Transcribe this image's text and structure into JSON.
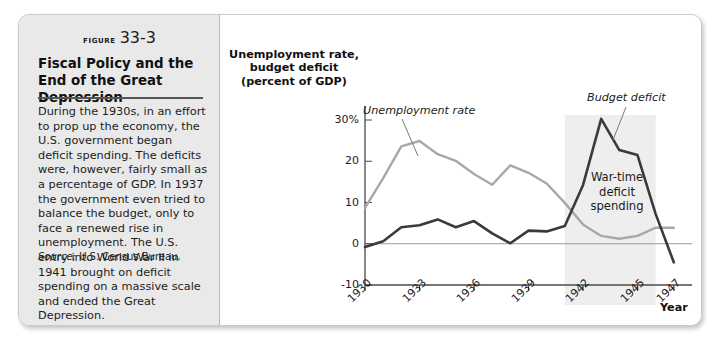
{
  "figure": {
    "number_word": "FIGURE",
    "number": "33-3",
    "title": "Fiscal Policy and the End of the Great Depression",
    "body": "During the 1930s, in an effort to prop up the economy, the U.S. government began deficit spending. The deficits were, however, fairly small as a percentage of GDP. In 1937 the government even tried to balance the budget, only to face a renewed rise in unemployment. The U.S. entry into World War II in 1941 brought on deficit spending on a massive scale and ended the Great Depression.",
    "source_word": "Source:",
    "source_text": "U.S. Census Bureau."
  },
  "chart_data": {
    "type": "line",
    "title": "",
    "ylabel": "Unemployment rate, budget deficit (percent of GDP)",
    "xlabel": "Year",
    "ylim": [
      -10,
      32
    ],
    "xlim": [
      1930,
      1948
    ],
    "grid": false,
    "legend_position": "inline-annotations",
    "y_ticks": [
      {
        "value": 30,
        "label": "30%"
      },
      {
        "value": 20,
        "label": "20"
      },
      {
        "value": 10,
        "label": "10"
      },
      {
        "value": 0,
        "label": "0"
      },
      {
        "value": -10,
        "label": "-10"
      }
    ],
    "x_ticks": [
      {
        "value": 1930,
        "label": "1930"
      },
      {
        "value": 1933,
        "label": "1933"
      },
      {
        "value": 1936,
        "label": "1936"
      },
      {
        "value": 1939,
        "label": "1939"
      },
      {
        "value": 1942,
        "label": "1942"
      },
      {
        "value": 1945,
        "label": "1945"
      },
      {
        "value": 1947,
        "label": "1947"
      }
    ],
    "x": [
      1930,
      1931,
      1932,
      1933,
      1934,
      1935,
      1936,
      1937,
      1938,
      1939,
      1940,
      1941,
      1942,
      1943,
      1944,
      1945,
      1946,
      1947
    ],
    "series": [
      {
        "name": "Unemployment rate",
        "color": "#a8a8a8",
        "values": [
          8.7,
          15.9,
          23.6,
          24.9,
          21.7,
          20.1,
          16.9,
          14.3,
          19.0,
          17.2,
          14.6,
          9.9,
          4.7,
          1.9,
          1.2,
          1.9,
          3.9,
          3.9
        ]
      },
      {
        "name": "Budget deficit",
        "color": "#3a3a3a",
        "values": [
          -0.8,
          0.6,
          4.0,
          4.5,
          5.9,
          4.0,
          5.5,
          2.5,
          0.1,
          3.2,
          3.0,
          4.3,
          14.2,
          30.3,
          22.7,
          21.5,
          7.2,
          -4.5
        ]
      }
    ],
    "annotations": [
      {
        "name": "unemployment-rate",
        "text": "Unemployment rate"
      },
      {
        "name": "budget-deficit",
        "text": "Budget deficit"
      },
      {
        "name": "wartime-shading",
        "text": "War-time deficit spending",
        "lines": [
          "War-time",
          "deficit",
          "spending"
        ],
        "x_start": 1941,
        "x_end": 1946,
        "color": "#eeeeee"
      }
    ]
  }
}
